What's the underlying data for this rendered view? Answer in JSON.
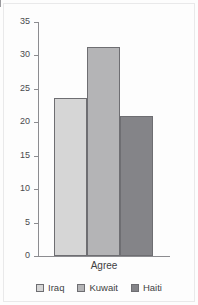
{
  "chart_data": {
    "type": "bar",
    "title": "",
    "subtitle": "",
    "xlabel": "Agree",
    "ylabel": "",
    "categories": [
      "Agree"
    ],
    "series": [
      {
        "name": "Iraq",
        "values": [
          23.6
        ],
        "color": "#d6d6d6"
      },
      {
        "name": "Kuwait",
        "values": [
          31.2
        ],
        "color": "#b4b4b6"
      },
      {
        "name": "Haiti",
        "values": [
          20.9
        ],
        "color": "#848488"
      }
    ],
    "ylim": [
      0,
      35
    ],
    "yticks": [
      0,
      5,
      10,
      15,
      20,
      25,
      30,
      35
    ],
    "ytick_labels": [
      "0",
      "5",
      "10",
      "15",
      "20",
      "25",
      "30",
      "35"
    ],
    "grid": false,
    "legend_position": "bottom",
    "axis_color": "#8c8c90",
    "bar_edge_color": "#6e6e72",
    "background": "#fdfdfd"
  },
  "axis": {
    "x_category_label": "Agree"
  },
  "legend": {
    "entries": [
      {
        "label": "Iraq"
      },
      {
        "label": "Kuwait"
      },
      {
        "label": "Haiti"
      }
    ]
  }
}
